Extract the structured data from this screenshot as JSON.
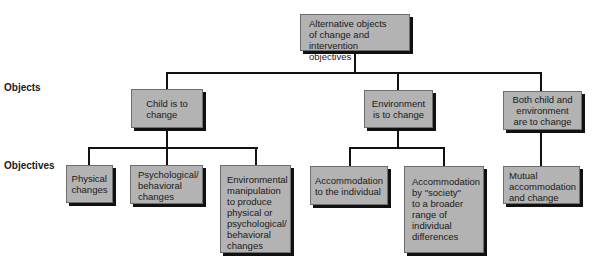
{
  "row_labels": {
    "objects": "Objects",
    "objectives": "Objectives"
  },
  "root": {
    "label": "Alternative objects\nof change and\nintervention objectives"
  },
  "objects": [
    {
      "label": "Child is to\nchange",
      "objectives": [
        {
          "label": "Physical\nchanges"
        },
        {
          "label": "Psychological/\nbehavioral\nchanges"
        },
        {
          "label": "Environmental\nmanipulation\nto produce\nphysical or\npsychological/\nbehavioral\nchanges"
        }
      ]
    },
    {
      "label": "Environment\nis to change",
      "objectives": [
        {
          "label": "Accommodation\nto the individual"
        },
        {
          "label": "Accommodation\nby \"society\"\nto a broader\nrange of\nindividual\ndifferences"
        }
      ]
    },
    {
      "label": "Both child and\nenvironment\nare to change",
      "objectives": [
        {
          "label": "Mutual\naccommodation\nand change"
        }
      ]
    }
  ],
  "colors": {
    "box_fill": "#b3b3b3",
    "shadow": "#111111",
    "line": "#111111"
  }
}
